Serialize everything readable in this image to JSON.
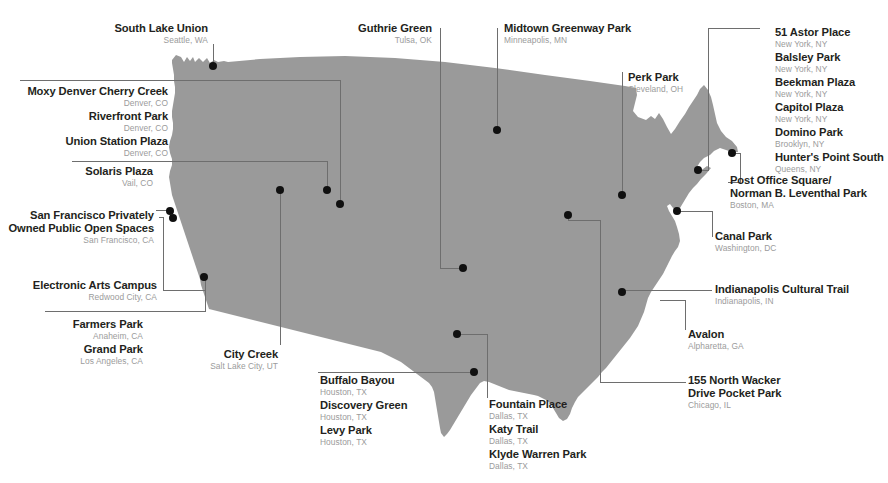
{
  "map": {
    "region_name": "United States",
    "fill_color": "#9a9a9a",
    "leader_line_color": "#6e6e6e",
    "dot_color": "#101010",
    "background_color": "#ffffff",
    "title_color": "#231f20",
    "subtitle_color": "#9b9b9b"
  },
  "callouts": {
    "south_lake_union": {
      "items": [
        {
          "name": "South Lake Union",
          "location": "Seattle, WA"
        }
      ]
    },
    "denver_group": {
      "items": [
        {
          "name": "Moxy Denver Cherry Creek",
          "location": "Denver, CO"
        },
        {
          "name": "Riverfront Park",
          "location": "Denver, CO"
        },
        {
          "name": "Union Station Plaza",
          "location": "Denver, CO"
        }
      ]
    },
    "vail_group": {
      "items": [
        {
          "name": "Solaris Plaza",
          "location": "Vail, CO"
        }
      ]
    },
    "san_francisco_group": {
      "items": [
        {
          "name": "San Francisco Privately Owned Public Open Spaces",
          "location": "San Francisco, CA"
        }
      ]
    },
    "redwood_city_group": {
      "items": [
        {
          "name": "Electronic Arts Campus",
          "location": "Redwood City, CA"
        }
      ]
    },
    "socal_group": {
      "items": [
        {
          "name": "Farmers Park",
          "location": "Anaheim, CA"
        },
        {
          "name": "Grand Park",
          "location": "Los Angeles, CA"
        }
      ]
    },
    "salt_lake_group": {
      "items": [
        {
          "name": "City Creek",
          "location": "Salt Lake City, UT"
        }
      ]
    },
    "houston_group": {
      "items": [
        {
          "name": "Buffalo Bayou",
          "location": "Houston, TX"
        },
        {
          "name": "Discovery Green",
          "location": "Houston, TX"
        },
        {
          "name": "Levy Park",
          "location": "Houston, TX"
        }
      ]
    },
    "dallas_group": {
      "items": [
        {
          "name": "Fountain Place",
          "location": "Dallas, TX"
        },
        {
          "name": "Katy Trail",
          "location": "Dallas, TX"
        },
        {
          "name": "Klyde Warren Park",
          "location": "Dallas, TX"
        }
      ]
    },
    "tulsa_group": {
      "items": [
        {
          "name": "Guthrie Green",
          "location": "Tulsa, OK"
        }
      ]
    },
    "minneapolis_group": {
      "items": [
        {
          "name": "Midtown Greenway Park",
          "location": "Minneapolis, MN"
        }
      ]
    },
    "cleveland_group": {
      "items": [
        {
          "name": "Perk Park",
          "location": "Cleveland, OH"
        }
      ]
    },
    "newyork_group": {
      "items": [
        {
          "name": "51 Astor Place",
          "location": "New York, NY"
        },
        {
          "name": "Balsley Park",
          "location": "New York, NY"
        },
        {
          "name": "Beekman Plaza",
          "location": "New York, NY"
        },
        {
          "name": "Capitol Plaza",
          "location": "New York, NY"
        },
        {
          "name": "Domino Park",
          "location": "Brooklyn, NY"
        },
        {
          "name": "Hunter's Point South",
          "location": "Queens, NY"
        }
      ]
    },
    "boston_group": {
      "items": [
        {
          "name": "Post Office Square/",
          "name2": "Norman B. Leventhal Park",
          "location": "Boston, MA"
        }
      ]
    },
    "washington_group": {
      "items": [
        {
          "name": "Canal Park",
          "location": "Washington, DC"
        }
      ]
    },
    "indianapolis_group": {
      "items": [
        {
          "name": "Indianapolis Cultural Trail",
          "location": "Indianapolis, IN"
        }
      ]
    },
    "atlanta_group": {
      "items": [
        {
          "name": "Avalon",
          "location": "Alpharetta, GA"
        }
      ]
    },
    "chicago_group": {
      "items": [
        {
          "name": "155 North Wacker",
          "name2": "Drive Pocket Park",
          "location": "Chicago, IL"
        }
      ]
    }
  },
  "markers": [
    {
      "id": "seattle",
      "label": "South Lake Union",
      "x": 213,
      "y": 66
    },
    {
      "id": "denver",
      "label": "Denver parks",
      "x": 340,
      "y": 204
    },
    {
      "id": "vail",
      "label": "Solaris Plaza",
      "x": 327,
      "y": 190
    },
    {
      "id": "san-francisco",
      "label": "San Francisco POPOS",
      "x": 170,
      "y": 211
    },
    {
      "id": "redwood-city",
      "label": "Electronic Arts Campus",
      "x": 173,
      "y": 218
    },
    {
      "id": "los-angeles",
      "label": "Grand Park / Farmers Park",
      "x": 204,
      "y": 277
    },
    {
      "id": "salt-lake-city",
      "label": "City Creek",
      "x": 280,
      "y": 190
    },
    {
      "id": "houston",
      "label": "Houston parks",
      "x": 474,
      "y": 372
    },
    {
      "id": "dallas",
      "label": "Dallas parks",
      "x": 457,
      "y": 334
    },
    {
      "id": "tulsa",
      "label": "Guthrie Green",
      "x": 463,
      "y": 268
    },
    {
      "id": "minneapolis",
      "label": "Midtown Greenway Park",
      "x": 497,
      "y": 130
    },
    {
      "id": "cleveland",
      "label": "Perk Park",
      "x": 622,
      "y": 195
    },
    {
      "id": "new-york",
      "label": "New York parks",
      "x": 698,
      "y": 170
    },
    {
      "id": "boston",
      "label": "Post Office Square",
      "x": 732,
      "y": 153
    },
    {
      "id": "washington",
      "label": "Canal Park",
      "x": 677,
      "y": 211
    },
    {
      "id": "indianapolis",
      "label": "Indianapolis Cultural Trail",
      "x": 622,
      "y": 292
    },
    {
      "id": "atlanta",
      "label": "Avalon",
      "x": 620,
      "y": 292
    },
    {
      "id": "chicago",
      "label": "155 North Wacker Drive",
      "x": 568,
      "y": 215
    }
  ]
}
